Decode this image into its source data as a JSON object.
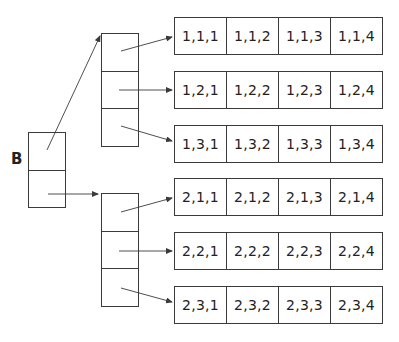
{
  "title": "B",
  "root": {
    "label": "B",
    "cells": 2
  },
  "level1": [
    {
      "index": 1,
      "cells": 3
    },
    {
      "index": 2,
      "cells": 3
    }
  ],
  "rows": [
    {
      "id": "1,1",
      "cells": [
        "1,1,1",
        "1,1,2",
        "1,1,3",
        "1,1,4"
      ]
    },
    {
      "id": "1,2",
      "cells": [
        "1,2,1",
        "1,2,2",
        "1,2,3",
        "1,2,4"
      ]
    },
    {
      "id": "1,3",
      "cells": [
        "1,3,1",
        "1,3,2",
        "1,3,3",
        "1,3,4"
      ]
    },
    {
      "id": "2,1",
      "cells": [
        "2,1,1",
        "2,1,2",
        "2,1,3",
        "2,1,4"
      ]
    },
    {
      "id": "2,2",
      "cells": [
        "2,2,1",
        "2,2,2",
        "2,2,3",
        "2,2,4"
      ]
    },
    {
      "id": "2,3",
      "cells": [
        "2,3,1",
        "2,3,2",
        "2,3,3",
        "2,3,4"
      ]
    }
  ],
  "colors": {
    "stroke": "#3a3a3a",
    "text": "#222222",
    "background": "#ffffff"
  }
}
